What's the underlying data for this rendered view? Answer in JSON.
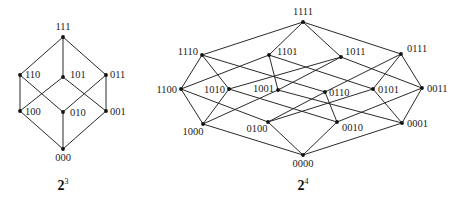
{
  "diagrams": [
    {
      "id": "lattice-2-3",
      "caption": {
        "base": "2",
        "exponent": "3",
        "x": 63,
        "y": 190
      },
      "nodes": [
        {
          "id": "111",
          "x": 63,
          "y": 37,
          "lx": 63,
          "ly": 30,
          "anchor": "middle"
        },
        {
          "id": "110",
          "x": 20,
          "y": 75,
          "lx": 25,
          "ly": 78,
          "anchor": "start"
        },
        {
          "id": "101",
          "x": 63,
          "y": 77,
          "lx": 70,
          "ly": 78,
          "anchor": "start"
        },
        {
          "id": "011",
          "x": 106,
          "y": 75,
          "lx": 110,
          "ly": 78,
          "anchor": "start"
        },
        {
          "id": "100",
          "x": 20,
          "y": 111,
          "lx": 25,
          "ly": 115,
          "anchor": "start"
        },
        {
          "id": "010",
          "x": 63,
          "y": 112,
          "lx": 70,
          "ly": 116,
          "anchor": "start"
        },
        {
          "id": "001",
          "x": 106,
          "y": 111,
          "lx": 110,
          "ly": 115,
          "anchor": "start"
        },
        {
          "id": "000",
          "x": 63,
          "y": 149,
          "lx": 63,
          "ly": 161,
          "anchor": "middle"
        }
      ]
    },
    {
      "id": "lattice-2-4",
      "caption": {
        "base": "2",
        "exponent": "4",
        "x": 303,
        "y": 190
      },
      "nodes": [
        {
          "id": "1111",
          "x": 303,
          "y": 22,
          "lx": 303,
          "ly": 15,
          "anchor": "middle"
        },
        {
          "id": "1110",
          "x": 202,
          "y": 55,
          "lx": 198,
          "ly": 55,
          "anchor": "end"
        },
        {
          "id": "1101",
          "x": 269,
          "y": 55,
          "lx": 277,
          "ly": 55,
          "anchor": "start"
        },
        {
          "id": "1011",
          "x": 341,
          "y": 57,
          "lx": 345,
          "ly": 55,
          "anchor": "start"
        },
        {
          "id": "0111",
          "x": 401,
          "y": 54,
          "lx": 407,
          "ly": 52,
          "anchor": "start"
        },
        {
          "id": "1100",
          "x": 181,
          "y": 89,
          "lx": 177,
          "ly": 93,
          "anchor": "end"
        },
        {
          "id": "1010",
          "x": 229,
          "y": 89,
          "lx": 225,
          "ly": 93,
          "anchor": "end"
        },
        {
          "id": "1001",
          "x": 278,
          "y": 90,
          "lx": 274,
          "ly": 92,
          "anchor": "end"
        },
        {
          "id": "0110",
          "x": 325,
          "y": 92,
          "lx": 329,
          "ly": 96,
          "anchor": "start"
        },
        {
          "id": "0101",
          "x": 373,
          "y": 89,
          "lx": 378,
          "ly": 93,
          "anchor": "start"
        },
        {
          "id": "0011",
          "x": 422,
          "y": 88,
          "lx": 427,
          "ly": 92,
          "anchor": "start"
        },
        {
          "id": "1000",
          "x": 203,
          "y": 124,
          "lx": 193,
          "ly": 135,
          "anchor": "middle"
        },
        {
          "id": "0100",
          "x": 268,
          "y": 122,
          "lx": 257,
          "ly": 132,
          "anchor": "middle"
        },
        {
          "id": "0010",
          "x": 337,
          "y": 122,
          "lx": 342,
          "ly": 131,
          "anchor": "start"
        },
        {
          "id": "0001",
          "x": 402,
          "y": 123,
          "lx": 407,
          "ly": 127,
          "anchor": "start"
        },
        {
          "id": "0000",
          "x": 303,
          "y": 155,
          "lx": 303,
          "ly": 167,
          "anchor": "middle"
        }
      ]
    }
  ],
  "style": {
    "edge_color": "#2a2a2a",
    "node_color": "#111111",
    "text_color": "#222222",
    "background": "#ffffff"
  }
}
